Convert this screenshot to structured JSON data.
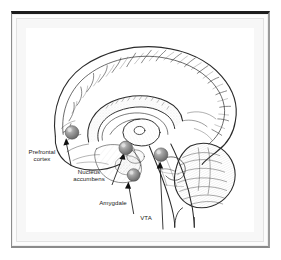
{
  "figure": {
    "view": "mid-sagittal section of the human brain",
    "style": "black and white engraving / line drawing",
    "frame_color": "#1c1c1c",
    "canvas_color": "#ffffff",
    "ink_color": "#2b2b2b",
    "marker_color": "#8c8c8c",
    "marker_highlight": "#cfcfcf"
  },
  "labels": [
    {
      "id": "prefrontal-cortex",
      "lines": [
        "Prefrontal",
        "cortex"
      ],
      "line1": "Prefrontal",
      "line2": "cortex"
    },
    {
      "id": "nucleus-accumbens",
      "lines": [
        "Nucleus",
        "accumbens"
      ],
      "line1": "Nucleus",
      "line2": "accumbens"
    },
    {
      "id": "amygdale",
      "lines": [
        "Amygdale"
      ],
      "line1": "Amygdale",
      "line2": ""
    },
    {
      "id": "vta",
      "lines": [
        "VTA"
      ],
      "line1": "VTA",
      "line2": ""
    }
  ],
  "markers": [
    {
      "id": "marker-prefrontal-cortex",
      "label": "Prefrontal cortex",
      "cx": 47,
      "cy": 108,
      "r": 7
    },
    {
      "id": "marker-nucleus-accumbens",
      "label": "Nucleus accumbens",
      "cx": 102,
      "cy": 124,
      "r": 7
    },
    {
      "id": "marker-amygdale",
      "label": "Amygdale",
      "cx": 110,
      "cy": 152,
      "r": 6.5
    },
    {
      "id": "marker-vta",
      "label": "VTA",
      "cx": 138,
      "cy": 131,
      "r": 7
    }
  ],
  "anatomy_regions": [
    "cerebral cortex",
    "corpus callosum",
    "thalamus",
    "cerebellum",
    "brainstem",
    "spinal cord"
  ]
}
